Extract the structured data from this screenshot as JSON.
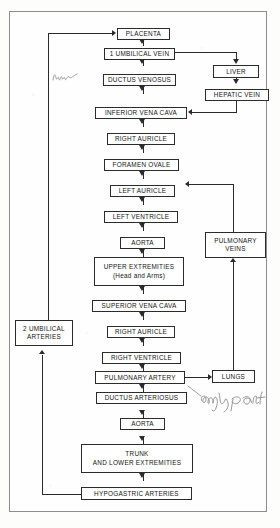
{
  "diagram": {
    "nodes": {
      "placenta": "PLACENTA",
      "umbilical_vein": "1 UMBILICAL VEIN",
      "ductus_venosus": "DUCTUS VENOSUS",
      "liver": "LIVER",
      "hepatic_vein": "HEPATIC VEIN",
      "inferior_vena_cava": "INFERIOR VENA CAVA",
      "right_auricle_1": "RIGHT AURICLE",
      "foramen_ovale": "FORAMEN OVALE",
      "left_auricle": "LEFT AURICLE",
      "left_ventricle": "LEFT VENTRICLE",
      "aorta_1": "AORTA",
      "upper_extremities": "UPPER EXTREMITIES\n(Head and Arms)",
      "superior_vena_cava": "SUPERIOR VENA CAVA",
      "right_auricle_2": "RIGHT AURICLE",
      "right_ventricle": "RIGHT VENTRICLE",
      "pulmonary_artery": "PULMONARY ARTERY",
      "lungs": "LUNGS",
      "pulmonary_veins": "PULMONARY\nVEINS",
      "ductus_arteriosus": "DUCTUS ARTERIOSUS",
      "aorta_2": "AORTA",
      "trunk": "TRUNK\nAND LOWER EXTREMITIES",
      "hypogastric_arteries": "HYPOGASTRIC ARTERIES",
      "umbilical_arteries": "2 UMBILICAL\nARTERIES"
    },
    "annotations": {
      "scribble_left": "",
      "only_part": "only part"
    },
    "colors": {
      "ink": "#2b2b2b",
      "paper": "#fefefe",
      "frame": "#8d8d8d",
      "pencil": "#6a6a6a"
    }
  }
}
